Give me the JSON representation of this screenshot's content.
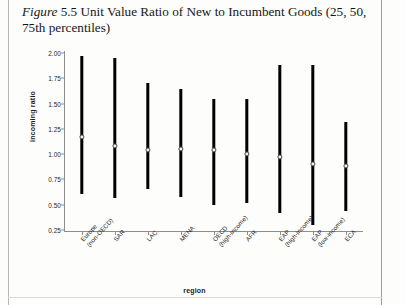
{
  "caption": {
    "figure_word": "Figure",
    "number": "5.5",
    "text": " Unit Value Ratio of New to Incumbent Goods (25, 50, 75th percentiles)"
  },
  "chart_data": {
    "type": "bar",
    "xlabel": "region",
    "ylabel": "incoming ratio",
    "ylim": [
      0.25,
      2.0
    ],
    "yticks": [
      "0.25",
      "0.50",
      "0.75",
      "1.00",
      "1.25",
      "1.50",
      "1.75",
      "2.00"
    ],
    "ytick_values": [
      0.25,
      0.5,
      0.75,
      1.0,
      1.25,
      1.5,
      1.75,
      2.0
    ],
    "grid": false,
    "legend": null,
    "categories": [
      "Europe (non-OECD)",
      "SAR",
      "LAC",
      "MENA",
      "OECD (high-income)",
      "AFR",
      "EAP (high-income)",
      "EAP (low-income)",
      "ECA"
    ],
    "category_lines": [
      [
        "Europe",
        "(non-OECD)"
      ],
      [
        "SAR",
        ""
      ],
      [
        "LAC",
        ""
      ],
      [
        "MENA",
        ""
      ],
      [
        "OECD",
        "(high-income)"
      ],
      [
        "AFR",
        ""
      ],
      [
        "EAP",
        "(high-income)"
      ],
      [
        "EAP",
        "(low-income)"
      ],
      [
        "ECA",
        ""
      ]
    ],
    "series": [
      {
        "name": "75th percentile",
        "values": [
          1.97,
          1.95,
          1.7,
          1.64,
          1.55,
          1.55,
          1.88,
          1.88,
          1.32
        ]
      },
      {
        "name": "50th percentile (median)",
        "values": [
          1.17,
          1.08,
          1.04,
          1.05,
          1.04,
          1.0,
          0.97,
          0.9,
          0.88
        ]
      },
      {
        "name": "25th percentile",
        "values": [
          0.61,
          0.57,
          0.66,
          0.58,
          0.5,
          0.52,
          0.42,
          0.3,
          0.44
        ]
      }
    ]
  },
  "colors": {
    "bar": "#000000",
    "median_fill": "#f2f2f2",
    "axis": "#8d8d8d",
    "text": "#1d1d1d",
    "page": "#fdfdfc"
  }
}
